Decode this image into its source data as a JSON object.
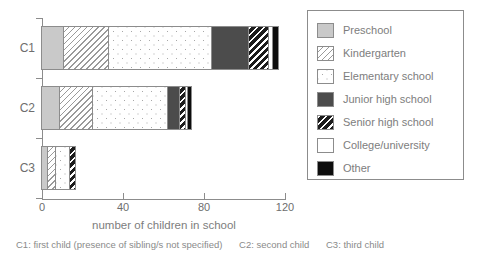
{
  "chart_data": {
    "type": "bar",
    "orientation": "horizontal",
    "stacked": true,
    "title": "",
    "xlabel": "number of children in school",
    "ylabel": "",
    "xlim": [
      0,
      120
    ],
    "xticks": [
      0,
      40,
      80,
      120
    ],
    "xtick_labels": [
      "0",
      "40",
      "80",
      "120"
    ],
    "grid": false,
    "legend_position": "right-outside",
    "categories": [
      "C1",
      "C2",
      "C3"
    ],
    "series": [
      {
        "name": "Preschool",
        "pattern": "solid-light-gray",
        "color": "#c9c9c9",
        "values": [
          11,
          9,
          3
        ]
      },
      {
        "name": "Kindergarten",
        "pattern": "diagonal-hatch",
        "color": "#9a9a9a",
        "values": [
          22,
          16,
          4
        ]
      },
      {
        "name": "Elementary school",
        "pattern": "dotted",
        "color": "#a8a8a8",
        "values": [
          51,
          37,
          7
        ]
      },
      {
        "name": "Junior high school",
        "pattern": "solid-dark-gray",
        "color": "#4c4c4c",
        "values": [
          18,
          6,
          0
        ]
      },
      {
        "name": "Senior high school",
        "pattern": "dense-diagonal",
        "color": "#1c1c1c",
        "values": [
          10,
          3,
          3
        ]
      },
      {
        "name": "College/university",
        "pattern": "solid-white",
        "color": "#ffffff",
        "values": [
          2,
          1,
          0
        ]
      },
      {
        "name": "Other",
        "pattern": "solid-black",
        "color": "#0d0d0d",
        "values": [
          3,
          2,
          0
        ]
      }
    ],
    "totals": [
      117,
      74,
      17
    ],
    "annotations": [
      "C1: first child (presence of sibling/s not specified)",
      "C2: second child",
      "C3: third child"
    ]
  },
  "legend": {
    "items": [
      {
        "label": "Preschool"
      },
      {
        "label": "Kindergarten"
      },
      {
        "label": "Elementary school"
      },
      {
        "label": "Junior high school"
      },
      {
        "label": "Senior high school"
      },
      {
        "label": "College/university"
      },
      {
        "label": "Other"
      }
    ]
  },
  "footnote": {
    "c1": "C1: first child (presence of sibling/s not specified)",
    "c2": "C2: second child",
    "c3": "C3: third child"
  }
}
